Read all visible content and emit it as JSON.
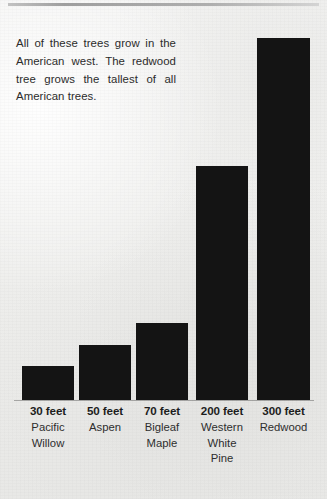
{
  "caption": {
    "text": "All of these trees grow in the American west. The redwood tree grows the tallest of all American trees."
  },
  "chart_data": {
    "type": "bar",
    "title": "",
    "xlabel": "",
    "ylabel": "",
    "unit": "feet",
    "grid": false,
    "legend": false,
    "ylim": [
      0,
      300
    ],
    "categories": [
      "Pacific Willow",
      "Aspen",
      "Bigleaf Maple",
      "Western White Pine",
      "Redwood"
    ],
    "values": [
      30,
      50,
      70,
      200,
      300
    ],
    "value_labels": [
      "30 feet",
      "50 feet",
      "70 feet",
      "200 feet",
      "300 feet"
    ],
    "bar_color": "#141414",
    "bars": [
      {
        "value_label": "30 feet",
        "species": "Pacific Willow",
        "species_lines": [
          "Pacific",
          "Willow"
        ],
        "value": 30,
        "x": 22,
        "width": 52,
        "top": 366
      },
      {
        "value_label": "50 feet",
        "species": "Aspen",
        "species_lines": [
          "Aspen"
        ],
        "value": 50,
        "x": 79,
        "width": 52,
        "top": 345
      },
      {
        "value_label": "70 feet",
        "species": "Bigleaf Maple",
        "species_lines": [
          "Bigleaf",
          "Maple"
        ],
        "value": 70,
        "x": 136,
        "width": 52,
        "top": 323
      },
      {
        "value_label": "200 feet",
        "species": "Western White Pine",
        "species_lines": [
          "Western",
          "White",
          "Pine"
        ],
        "value": 200,
        "x": 196,
        "width": 52,
        "top": 166
      },
      {
        "value_label": "300 feet",
        "species": "Redwood",
        "species_lines": [
          "Redwood"
        ],
        "value": 300,
        "x": 257,
        "width": 53,
        "top": 38
      }
    ],
    "baseline_y": 400
  }
}
